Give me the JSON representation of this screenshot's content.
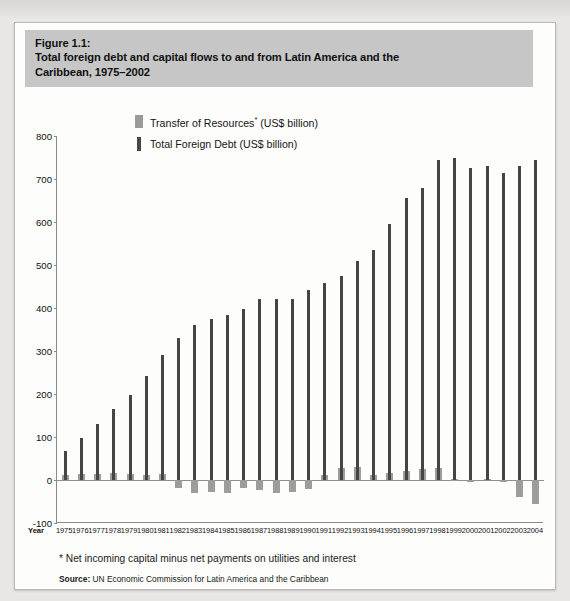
{
  "figure": {
    "label": "Figure 1.1:",
    "title_line1": "Total foreign debt and capital flows to and from Latin America and the",
    "title_line2": "Caribbean, 1975–2002"
  },
  "legend": {
    "transfer_label": "Transfer of Resources",
    "transfer_sup": "*",
    "transfer_units": " (US$ billion)",
    "debt_label": "Total Foreign Debt (US$ billion)"
  },
  "axis": {
    "x_name": "Year"
  },
  "footnote": "* Net incoming capital minus net payments on utilities and interest",
  "source": {
    "label": "Source:",
    "text": "UN Economic Commission for Latin America and the Caribbean"
  },
  "colors": {
    "debt": "#454545",
    "transfer": "#9d9d9d",
    "title_band": "#c6c6c6",
    "frame": "#fdfdfc",
    "axis": "#8b8b8b"
  },
  "chart_data": {
    "type": "bar",
    "title": "Total foreign debt and capital flows to and from Latin America and the Caribbean, 1975–2002",
    "xlabel": "Year",
    "ylabel": "",
    "ylim": [
      -100,
      800
    ],
    "yticks": [
      800,
      700,
      600,
      500,
      400,
      300,
      200,
      100,
      0,
      -100
    ],
    "grid": false,
    "legend_position": "top-center",
    "categories": [
      "1975",
      "1976",
      "1977",
      "1978",
      "1979",
      "1980",
      "1981",
      "1982",
      "1983",
      "1984",
      "1985",
      "1986",
      "1987",
      "1988",
      "1989",
      "1990",
      "1991",
      "1992",
      "1993",
      "1994",
      "1995",
      "1996",
      "1997",
      "1998",
      "1999",
      "2000",
      "2001",
      "2002",
      "2003",
      "2004"
    ],
    "series": [
      {
        "name": "Total Foreign Debt (US$ billion)",
        "color": "#454545",
        "values": [
          68,
          97,
          130,
          165,
          198,
          242,
          290,
          330,
          360,
          375,
          383,
          398,
          422,
          420,
          422,
          443,
          457,
          475,
          510,
          535,
          595,
          655,
          680,
          745,
          750,
          725,
          730,
          715,
          730,
          745
        ]
      },
      {
        "name": "Transfer of Resources* (US$ billion)",
        "color": "#9d9d9d",
        "values": [
          11,
          13,
          13,
          17,
          14,
          12,
          13,
          -19,
          -31,
          -27,
          -30,
          -18,
          -24,
          -30,
          -27,
          -20,
          12,
          27,
          31,
          12,
          16,
          20,
          25,
          29,
          2,
          -2,
          3,
          -2,
          -40,
          -55
        ]
      }
    ]
  }
}
